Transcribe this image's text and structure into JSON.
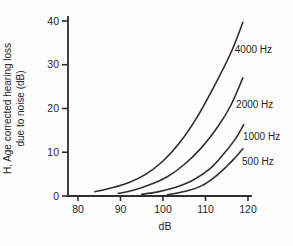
{
  "figure": {
    "background": "#fdfdfd",
    "ink_color": "#2e2e2e",
    "text_color": "#262626"
  },
  "chart_data": {
    "type": "line",
    "title": "",
    "xlabel": "dB",
    "ylabel_line1": "H, Age corrected hearing loss",
    "ylabel_line2": "due to noise (dB)",
    "xlim": [
      80,
      120
    ],
    "ylim": [
      0,
      40
    ],
    "xticks": [
      80,
      90,
      100,
      110,
      120
    ],
    "yticks": [
      0,
      10,
      20,
      30,
      40
    ],
    "grid": false,
    "legend_position": "inline-right-labels",
    "series": [
      {
        "name": "4000 Hz",
        "points": [
          [
            84,
            1
          ],
          [
            88,
            1.9
          ],
          [
            92,
            3.1
          ],
          [
            96,
            5
          ],
          [
            100,
            8
          ],
          [
            104,
            12.3
          ],
          [
            108,
            18
          ],
          [
            112,
            25
          ],
          [
            116,
            32.8
          ],
          [
            118.8,
            39.7
          ]
        ],
        "label": {
          "text": "4000 Hz",
          "x": 116.9,
          "y": 33.4
        }
      },
      {
        "name": "2000 Hz",
        "points": [
          [
            89.5,
            0.6
          ],
          [
            93,
            1.3
          ],
          [
            97,
            2.6
          ],
          [
            101,
            4.4
          ],
          [
            105,
            7.2
          ],
          [
            109,
            11
          ],
          [
            113,
            16
          ],
          [
            116,
            20.8
          ],
          [
            118.8,
            27
          ]
        ],
        "label": {
          "text": "2000 Hz",
          "x": 117.2,
          "y": 21.0
        }
      },
      {
        "name": "1000 Hz",
        "points": [
          [
            95,
            0.4
          ],
          [
            99,
            1
          ],
          [
            103,
            2
          ],
          [
            107,
            3.6
          ],
          [
            111,
            6.2
          ],
          [
            114,
            9.3
          ],
          [
            117,
            13
          ],
          [
            119,
            16.3
          ]
        ],
        "label": {
          "text": "1000 Hz",
          "x": 118.8,
          "y": 13.5
        }
      },
      {
        "name": "500 Hz",
        "points": [
          [
            101,
            0.3
          ],
          [
            105,
            1
          ],
          [
            109,
            2.3
          ],
          [
            112,
            4.2
          ],
          [
            115,
            6.8
          ],
          [
            117,
            8.8
          ],
          [
            118.8,
            10.8
          ]
        ],
        "label": {
          "text": "500 Hz",
          "x": 118.6,
          "y": 8.0
        }
      }
    ]
  }
}
